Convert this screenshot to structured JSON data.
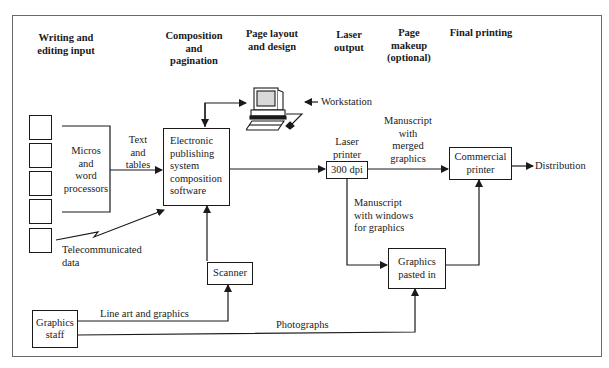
{
  "diagram": {
    "column_headers": [
      {
        "id": "writing",
        "label": "Writing and\nediting input"
      },
      {
        "id": "composition",
        "label": "Composition\nand\npagination"
      },
      {
        "id": "layout",
        "label": "Page layout\nand design"
      },
      {
        "id": "laser",
        "label": "Laser\noutput"
      },
      {
        "id": "makeup",
        "label": "Page\nmakeup\n(optional)"
      },
      {
        "id": "final",
        "label": "Final printing"
      }
    ],
    "nodes": {
      "input_squares": 5,
      "micros": "Micros\nand\nword\nprocessors",
      "eps": "Electronic\npublishing\nsystem\ncomposition\nsoftware",
      "workstation_icon": "computer-workstation",
      "laser_printer_box": "300 dpi",
      "commercial_printer": "Commercial\nprinter",
      "graphics_pasted": "Graphics\npasted in",
      "scanner": "Scanner",
      "graphics_staff": "Graphics\nstaff"
    },
    "labels": {
      "text_tables": "Text\nand\ntables",
      "telecom": "Telecommunicated\ndata",
      "workstation": "Workstation",
      "laser_printer": "Laser\nprinter",
      "ms_merged": "Manuscript\nwith\nmerged\ngraphics",
      "ms_windows": "Manuscript\nwith windows\nfor graphics",
      "distribution": "Distribution",
      "line_art": "Line art and graphics",
      "photographs": "Photographs"
    },
    "edges": [
      {
        "from": "micros",
        "to": "eps",
        "label": "Text and tables"
      },
      {
        "from": "input_squares",
        "to": "eps",
        "label": "Telecommunicated data"
      },
      {
        "from": "eps",
        "to": "workstation",
        "bidirectional": true
      },
      {
        "from": "eps",
        "to": "laser_printer_box"
      },
      {
        "from": "laser_printer_box",
        "to": "commercial_printer",
        "label": "Manuscript with merged graphics"
      },
      {
        "from": "laser_printer_box",
        "to": "graphics_pasted",
        "label": "Manuscript with windows for graphics"
      },
      {
        "from": "graphics_pasted",
        "to": "commercial_printer"
      },
      {
        "from": "commercial_printer",
        "to": "distribution"
      },
      {
        "from": "scanner",
        "to": "eps"
      },
      {
        "from": "graphics_staff",
        "to": "scanner",
        "label": "Line art and graphics"
      },
      {
        "from": "graphics_staff",
        "to": "graphics_pasted",
        "label": "Photographs"
      }
    ]
  }
}
